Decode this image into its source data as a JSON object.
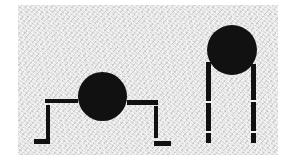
{
  "figure": {
    "colors": {
      "shape": "#111111",
      "background": "#e4e4e4",
      "page": "#ffffff"
    },
    "figures": [
      {
        "name": "crouching-figure",
        "pose": "arms/legs bent outward with feet",
        "circle": {
          "cx": 102,
          "cy": 96,
          "r": 24
        }
      },
      {
        "name": "standing-figure",
        "pose": "two long straight legs hanging from circle",
        "circle": {
          "cx": 232,
          "cy": 50,
          "r": 25
        },
        "leg_gaps": 2
      }
    ]
  }
}
